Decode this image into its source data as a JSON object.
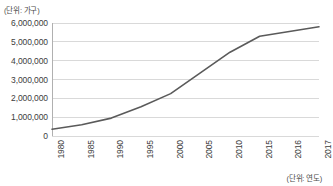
{
  "chart_data": {
    "type": "line",
    "title": "",
    "subtitle": "",
    "xlabel": "(단위: 연도)",
    "ylabel": "(단위: 가구)",
    "categories": [
      "1980",
      "1985",
      "1990",
      "1995",
      "2000",
      "2005",
      "2010",
      "2015",
      "2016",
      "2017"
    ],
    "values": [
      360000,
      600000,
      950000,
      1550000,
      2250000,
      3350000,
      4450000,
      5300000,
      5550000,
      5800000
    ],
    "series": [
      {
        "name": "가구 수",
        "values": [
          360000,
          600000,
          950000,
          1550000,
          2250000,
          3350000,
          4450000,
          5300000,
          5550000,
          5800000
        ],
        "color": "#5a5a5a"
      }
    ],
    "ylim": [
      0,
      6000000
    ],
    "ytick_values": [
      0,
      1000000,
      2000000,
      3000000,
      4000000,
      5000000,
      6000000
    ],
    "ytick_labels": [
      "0",
      "1,000,000",
      "2,000,000",
      "3,000,000",
      "4,000,000",
      "5,000,000",
      "6,000,000"
    ],
    "grid": true,
    "grid_axis": "y",
    "legend": false,
    "legend_position": "none",
    "line_color": "#5a5a5a",
    "grid_color": "#d9d9d9",
    "axis_color": "#b0b0b0",
    "background_color": "#ffffff",
    "markers": false
  },
  "axes": {
    "y_unit_label": "(단위: 가구)",
    "x_unit_label": "(단위: 연도)"
  }
}
